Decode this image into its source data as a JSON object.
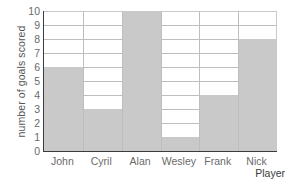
{
  "chart_data": {
    "type": "bar",
    "title": "",
    "xlabel": "Player",
    "ylabel": "number of goals scored",
    "categories": [
      "John",
      "Cyril",
      "Alan",
      "Wesley",
      "Frank",
      "Nick"
    ],
    "values": [
      6,
      3,
      10,
      1,
      4,
      8
    ],
    "ylim": [
      0,
      10
    ],
    "y_ticks": [
      0,
      1,
      2,
      3,
      4,
      5,
      6,
      7,
      8,
      9,
      10
    ],
    "y_tick_labels": [
      "0",
      "1",
      "2",
      "3",
      "4",
      "5",
      "6",
      "7",
      "8",
      "9",
      "10"
    ],
    "grid": "horizontal-and-vertical",
    "legend": "none",
    "bar_color": "#c9c9c9",
    "grid_color": "#bdbdbd",
    "axis_color": "#3c3c3c",
    "text_color": "#6a6a6a"
  }
}
